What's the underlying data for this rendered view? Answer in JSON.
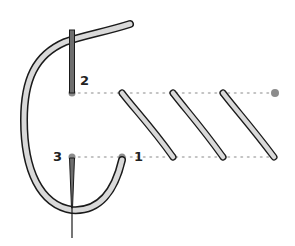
{
  "diagram": {
    "type": "embroidery-stitch-instruction",
    "colors": {
      "thread_fill": "#d9d9d9",
      "thread_outline": "#1a1a1a",
      "needle": "#6e6e6e",
      "point": "#8c8c8c",
      "guide_line": "#b0b0b0",
      "label": "#222222"
    },
    "labels": [
      {
        "id": "point-2",
        "text": "2"
      },
      {
        "id": "point-3",
        "text": "3"
      },
      {
        "id": "point-1",
        "text": "1"
      }
    ],
    "guide_lines": [
      "top",
      "bottom"
    ],
    "stitches_completed": 3
  }
}
